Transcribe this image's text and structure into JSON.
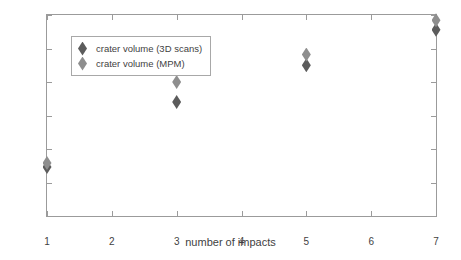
{
  "chart_data": {
    "type": "scatter",
    "title": "",
    "xlabel": "number of impacts",
    "ylabel": "volmume [m3]",
    "ylabel_base": "volmume [m",
    "ylabel_exponent": "3",
    "ylabel_close": "]",
    "xlim": [
      1,
      7
    ],
    "ylim": [
      0,
      3
    ],
    "grid": false,
    "legend_position": "upper-left-inside",
    "xticks": [
      1,
      2,
      3,
      4,
      5,
      6,
      7
    ],
    "xticklabels": [
      "1",
      "2",
      "3",
      "4",
      "5",
      "6",
      "7"
    ],
    "yticks": [
      0,
      0.5,
      1,
      1.5,
      2,
      2.5,
      3
    ],
    "yticklabels": [
      "0",
      "0.5",
      "1",
      "1.5",
      "2",
      "2.5",
      "3"
    ],
    "series": [
      {
        "name": "crater volume (3D scans)",
        "color": "#5c5c5c",
        "marker": "diamond",
        "x": [
          1,
          3,
          5,
          7
        ],
        "values": [
          0.73,
          1.7,
          2.25,
          2.78
        ]
      },
      {
        "name": "crater volume (MPM)",
        "color": "#8e8e8e",
        "marker": "diamond",
        "x": [
          1,
          3,
          5,
          7
        ],
        "values": [
          0.79,
          2.0,
          2.41,
          2.92
        ]
      }
    ]
  },
  "legend": {
    "items": [
      {
        "label": "crater volume (3D scans)"
      },
      {
        "label": "crater volume (MPM)"
      }
    ]
  }
}
